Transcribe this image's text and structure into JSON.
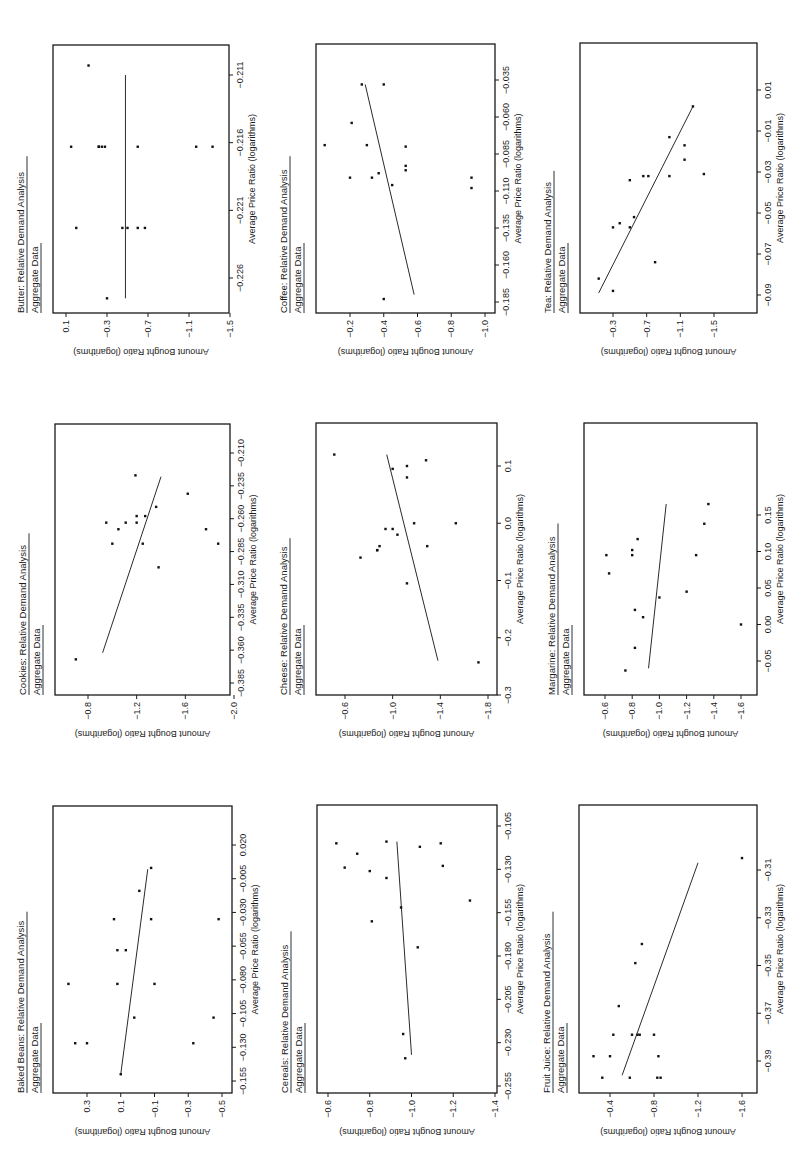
{
  "page": {
    "orientation": "rotated-90-ccw",
    "panel_subtitle": "Aggregate Data",
    "x_axis_label": "Average Price Ratio (logarithms)",
    "y_axis_label": "Amount Bought Ratio (logarithms)"
  },
  "chart_data": [
    {
      "type": "scatter",
      "title": "Butter: Relative Demand Analysis",
      "subtitle": "Aggregate Data",
      "xlabel": "Average Price Ratio (logarithms)",
      "ylabel": "Amount Bought Ratio (logarithms)",
      "xticks": [
        -0.226,
        -0.221,
        -0.216,
        -0.211
      ],
      "xtick_labels": [
        "-0.226",
        "-0.221",
        "-0.216",
        "-0.211"
      ],
      "yticks": [
        0.1,
        -0.3,
        -0.7,
        -1.1,
        -1.5
      ],
      "ytick_labels": [
        "0.1",
        "-0.3",
        "-0.7",
        "-1.1",
        "-1.5"
      ],
      "xlim": [
        -0.2288,
        -0.2086
      ],
      "ylim": [
        -1.5,
        0.2
      ],
      "points": [
        [
          -0.2275,
          -0.3
        ],
        [
          -0.2223,
          0.0
        ],
        [
          -0.2223,
          -0.45
        ],
        [
          -0.2223,
          -0.5
        ],
        [
          -0.2223,
          -0.6
        ],
        [
          -0.2223,
          -0.67
        ],
        [
          -0.2163,
          0.05
        ],
        [
          -0.2163,
          -0.22
        ],
        [
          -0.2163,
          -0.22
        ],
        [
          -0.2163,
          -0.25
        ],
        [
          -0.2163,
          -0.28
        ],
        [
          -0.2163,
          -0.6
        ],
        [
          -0.2163,
          -1.17
        ],
        [
          -0.2163,
          -1.33
        ],
        [
          -0.2103,
          -0.12
        ]
      ],
      "fit_line": [
        [
          -0.2275,
          -0.48
        ],
        [
          -0.211,
          -0.48
        ]
      ],
      "grid": false
    },
    {
      "type": "scatter",
      "title": "Coffee: Relative Demand Analysis",
      "subtitle": "Aggregate Data",
      "xlabel": "Average Price Ratio (logarithms)",
      "ylabel": "Amount Bought Ratio (logarithms)",
      "xticks": [
        -0.185,
        -0.16,
        -0.135,
        -0.11,
        -0.085,
        -0.06,
        -0.035
      ],
      "xtick_labels": [
        "-0.185",
        "-0.160",
        "-0.135",
        "-0.110",
        "-0.085",
        "-0.060",
        "-0.035"
      ],
      "yticks": [
        -0.2,
        -0.4,
        -0.6,
        -0.8,
        -1.0
      ],
      "ytick_labels": [
        "-0.2",
        "-0.4",
        "-0.6",
        "-0.8",
        "-1.0"
      ],
      "xlim": [
        -0.195,
        -0.025
      ],
      "ylim": [
        -1.05,
        0.05
      ],
      "points": [
        [
          -0.183,
          -0.4
        ],
        [
          -0.106,
          -0.45
        ],
        [
          -0.101,
          -0.2
        ],
        [
          -0.101,
          -0.33
        ],
        [
          -0.101,
          -0.92
        ],
        [
          -0.108,
          -0.92
        ],
        [
          -0.098,
          -0.37
        ],
        [
          -0.096,
          -0.53
        ],
        [
          -0.093,
          -0.53
        ],
        [
          -0.079,
          -0.05
        ],
        [
          -0.079,
          -0.3
        ],
        [
          -0.08,
          -0.53
        ],
        [
          -0.064,
          -0.21
        ],
        [
          -0.038,
          -0.27
        ],
        [
          -0.038,
          -0.4
        ]
      ],
      "fit_line": [
        [
          -0.18,
          -0.58
        ],
        [
          -0.038,
          -0.29
        ]
      ],
      "grid": false
    },
    {
      "type": "scatter",
      "title": "Tea: Relative Demand Analysis",
      "subtitle": "Aggregate Data",
      "xlabel": "Average Price Ratio (logarithms)",
      "ylabel": "Amount Bought Ratio (logarithms)",
      "xticks": [
        -0.09,
        -0.07,
        -0.05,
        -0.03,
        -0.01,
        0.01
      ],
      "xtick_labels": [
        "-0.09",
        "-0.07",
        "-0.05",
        "-0.03",
        "-0.01",
        "0.01"
      ],
      "yticks": [
        -0.3,
        -0.7,
        -1.1,
        -1.5
      ],
      "ytick_labels": [
        "-0.3",
        "-0.7",
        "-1.1",
        "-1.5"
      ],
      "xlim": [
        -0.1,
        0.01
      ],
      "ylim": [
        -1.5,
        -0.1
      ],
      "points": [
        [
          -0.088,
          -0.3
        ],
        [
          -0.082,
          -0.13
        ],
        [
          -0.074,
          -0.8
        ],
        [
          -0.057,
          -0.3
        ],
        [
          -0.057,
          -0.5
        ],
        [
          -0.055,
          -0.38
        ],
        [
          -0.052,
          -0.55
        ],
        [
          -0.034,
          -0.5
        ],
        [
          -0.032,
          -0.66
        ],
        [
          -0.032,
          -0.72
        ],
        [
          -0.032,
          -0.97
        ],
        [
          -0.031,
          -1.38
        ],
        [
          -0.024,
          -1.15
        ],
        [
          -0.017,
          -1.15
        ],
        [
          -0.013,
          -0.97
        ],
        [
          0.002,
          -1.25
        ]
      ],
      "fit_line": [
        [
          -0.089,
          -0.13
        ],
        [
          0.002,
          -1.25
        ]
      ],
      "grid": false
    },
    {
      "type": "scatter",
      "title": "Cookies: Relative Demand Analysis",
      "subtitle": "Aggregate Data",
      "xlabel": "Average Price Ratio (logarithms)",
      "ylabel": "Amount Bought Ratio (logarithms)",
      "xticks": [
        -0.385,
        -0.36,
        -0.335,
        -0.31,
        -0.285,
        -0.26,
        -0.235,
        -0.21
      ],
      "xtick_labels": [
        "-0.385",
        "-0.360",
        "-0.335",
        "-0.310",
        "-0.285",
        "-0.260",
        "-0.235",
        "-0.210"
      ],
      "yticks": [
        -0.8,
        -1.2,
        -1.6,
        -2.0
      ],
      "ytick_labels": [
        "-0.8",
        "-1.2",
        "-1.6",
        "-2.0"
      ],
      "xlim": [
        -0.395,
        -0.205
      ],
      "ylim": [
        -2.1,
        -0.6
      ],
      "points": [
        [
          -0.367,
          -0.7
        ],
        [
          -0.297,
          -1.38
        ],
        [
          -0.279,
          -1.0
        ],
        [
          -0.279,
          -1.25
        ],
        [
          -0.279,
          -1.87
        ],
        [
          -0.268,
          -1.05
        ],
        [
          -0.268,
          -1.77
        ],
        [
          -0.263,
          -0.95
        ],
        [
          -0.263,
          -1.11
        ],
        [
          -0.263,
          -1.2
        ],
        [
          -0.258,
          -1.2
        ],
        [
          -0.258,
          -1.27
        ],
        [
          -0.251,
          -1.36
        ],
        [
          -0.241,
          -1.62
        ],
        [
          -0.227,
          -1.19
        ]
      ],
      "fit_line": [
        [
          -0.362,
          -0.92
        ],
        [
          -0.228,
          -1.4
        ]
      ],
      "grid": false
    },
    {
      "type": "scatter",
      "title": "Cheese: Relative Demand Analysis",
      "subtitle": "Aggregate Data",
      "xlabel": "Average Price Ratio (logarithms)",
      "ylabel": "Amount Bought Ratio (logarithms)",
      "xticks": [
        -0.3,
        -0.2,
        -0.1,
        0.0,
        0.1
      ],
      "xtick_labels": [
        "-0.3",
        "-0.2",
        "-0.1",
        "0.0",
        "0.1"
      ],
      "yticks": [
        -0.6,
        -1.0,
        -1.4,
        -1.8
      ],
      "ytick_labels": [
        "-0.6",
        "-1.0",
        "-1.4",
        "-1.8"
      ],
      "xlim": [
        -0.3,
        0.17
      ],
      "ylim": [
        -1.8,
        -0.4
      ],
      "points": [
        [
          -0.243,
          -1.72
        ],
        [
          -0.105,
          -1.12
        ],
        [
          -0.06,
          -0.73
        ],
        [
          -0.047,
          -0.87
        ],
        [
          -0.047,
          -0.87
        ],
        [
          -0.04,
          -0.89
        ],
        [
          -0.04,
          -1.29
        ],
        [
          -0.02,
          -1.04
        ],
        [
          -0.01,
          -0.94
        ],
        [
          -0.01,
          -1.0
        ],
        [
          0.0,
          -1.18
        ],
        [
          0.0,
          -1.53
        ],
        [
          0.08,
          -1.12
        ],
        [
          0.095,
          -1.0
        ],
        [
          0.1,
          -1.12
        ],
        [
          0.11,
          -1.28
        ],
        [
          0.12,
          -0.51
        ]
      ],
      "fit_line": [
        [
          -0.24,
          -1.38
        ],
        [
          0.12,
          -0.95
        ]
      ],
      "grid": false
    },
    {
      "type": "scatter",
      "title": "Margarine: Relative Demand Analysis",
      "subtitle": "Aggregate Data",
      "xlabel": "Average Price Ratio (logarithms)",
      "ylabel": "Amount Bought Ratio (logarithms)",
      "xticks": [
        -0.05,
        0.0,
        0.05,
        0.1,
        0.15
      ],
      "xtick_labels": [
        "-0.05",
        "0.00",
        "0.05",
        "0.10",
        "0.15"
      ],
      "yticks": [
        -0.6,
        -0.8,
        -1.0,
        -1.2,
        -1.4,
        -1.6
      ],
      "ytick_labels": [
        "-0.6",
        "-0.8",
        "-1.0",
        "-1.2",
        "-1.4",
        "-1.6"
      ],
      "xlim": [
        -0.075,
        0.195
      ],
      "ylim": [
        -1.7,
        -0.48
      ],
      "points": [
        [
          -0.063,
          -0.75
        ],
        [
          -0.032,
          -0.82
        ],
        [
          0.01,
          -0.88
        ],
        [
          0.02,
          -0.82
        ],
        [
          0.037,
          -1.0
        ],
        [
          0.045,
          -1.2
        ],
        [
          0.07,
          -0.63
        ],
        [
          0.095,
          -0.61
        ],
        [
          0.095,
          -0.8
        ],
        [
          0.095,
          -1.27
        ],
        [
          0.102,
          -0.8
        ],
        [
          0.117,
          -0.84
        ],
        [
          0.138,
          -1.33
        ],
        [
          0.165,
          -1.36
        ],
        [
          0.0,
          -1.6
        ]
      ],
      "fit_line": [
        [
          -0.06,
          -0.92
        ],
        [
          0.165,
          -1.05
        ]
      ],
      "grid": false
    },
    {
      "type": "scatter",
      "title": "Baked Beans: Relative Demand Analysis",
      "subtitle": "Aggregate Data",
      "xlabel": "Average Price Ratio (logarithms)",
      "ylabel": "Amount Bought Ratio (logarithms)",
      "xticks": [
        -0.155,
        -0.13,
        -0.105,
        -0.08,
        -0.055,
        -0.03,
        -0.005,
        0.02
      ],
      "xtick_labels": [
        "-0.155",
        "-0.130",
        "-0.105",
        "-0.080",
        "-0.055",
        "-0.030",
        "-0.005",
        "0.020"
      ],
      "yticks": [
        0.3,
        0.1,
        -0.1,
        -0.3,
        -0.5
      ],
      "ytick_labels": [
        "0.3",
        "0.1",
        "-0.1",
        "-0.3",
        "-0.5"
      ],
      "xlim": [
        -0.165,
        0.03
      ],
      "ylim": [
        -0.55,
        0.5
      ],
      "points": [
        [
          -0.15,
          0.1
        ],
        [
          -0.127,
          0.37
        ],
        [
          -0.127,
          0.3
        ],
        [
          -0.127,
          -0.33
        ],
        [
          -0.108,
          0.02
        ],
        [
          -0.108,
          -0.45
        ],
        [
          -0.083,
          0.41
        ],
        [
          -0.083,
          0.12
        ],
        [
          -0.083,
          -0.1
        ],
        [
          -0.058,
          0.12
        ],
        [
          -0.058,
          0.07
        ],
        [
          -0.035,
          0.14
        ],
        [
          -0.035,
          -0.08
        ],
        [
          -0.035,
          -0.48
        ],
        [
          -0.014,
          -0.01
        ],
        [
          0.003,
          -0.08
        ]
      ],
      "fit_line": [
        [
          -0.15,
          0.1
        ],
        [
          0.002,
          -0.06
        ]
      ],
      "grid": false
    },
    {
      "type": "scatter",
      "title": "Cereals: Relative Demand Analysis",
      "subtitle": "Aggregate Data",
      "xlabel": "Average Price Ratio (logarithms)",
      "ylabel": "Amount Bought Ratio (logarithms)",
      "xticks": [
        -0.255,
        -0.23,
        -0.205,
        -0.18,
        -0.155,
        -0.13,
        -0.105
      ],
      "xtick_labels": [
        "-0.255",
        "-0.230",
        "-0.205",
        "-0.180",
        "-0.155",
        "-0.130",
        "-0.105"
      ],
      "yticks": [
        -0.6,
        -0.8,
        -1.0,
        -1.2,
        -1.4
      ],
      "ytick_labels": [
        "-0.6",
        "-0.8",
        "-1.0",
        "-1.2",
        "-1.4"
      ],
      "xlim": [
        -0.262,
        -0.098
      ],
      "ylim": [
        -1.4,
        -0.52
      ],
      "points": [
        [
          -0.239,
          -0.97
        ],
        [
          -0.225,
          -0.96
        ],
        [
          -0.175,
          -1.03
        ],
        [
          -0.16,
          -0.81
        ],
        [
          -0.152,
          -0.95
        ],
        [
          -0.148,
          -1.28
        ],
        [
          -0.135,
          -0.88
        ],
        [
          -0.131,
          -0.8
        ],
        [
          -0.129,
          -0.68
        ],
        [
          -0.128,
          -1.15
        ],
        [
          -0.121,
          -0.74
        ],
        [
          -0.117,
          -1.04
        ],
        [
          -0.114,
          -0.88
        ],
        [
          -0.115,
          -0.64
        ],
        [
          -0.115,
          -1.14
        ]
      ],
      "fit_line": [
        [
          -0.237,
          -1.0
        ],
        [
          -0.114,
          -0.93
        ]
      ],
      "grid": false
    },
    {
      "type": "scatter",
      "title": "Fruit Juice: Relative Demand Analysis",
      "subtitle": "Aggregate Data",
      "xlabel": "Average Price Ratio (logarithms)",
      "ylabel": "Amount Bought Ratio (logarithms)",
      "xticks": [
        -0.39,
        -0.37,
        -0.35,
        -0.33,
        -0.31
      ],
      "xtick_labels": [
        "-0.39",
        "-0.37",
        "-0.35",
        "-0.33",
        "-0.31"
      ],
      "yticks": [
        -0.4,
        -0.8,
        -1.2,
        -1.6
      ],
      "ytick_labels": [
        "-0.4",
        "-0.8",
        "-1.2",
        "-1.6"
      ],
      "xlim": [
        -0.403,
        -0.292
      ],
      "ylim": [
        -1.7,
        -0.15
      ],
      "points": [
        [
          -0.397,
          -0.33
        ],
        [
          -0.397,
          -0.58
        ],
        [
          -0.397,
          -0.83
        ],
        [
          -0.397,
          -0.86
        ],
        [
          -0.388,
          -0.25
        ],
        [
          -0.388,
          -0.4
        ],
        [
          -0.388,
          -0.84
        ],
        [
          -0.379,
          -0.43
        ],
        [
          -0.379,
          -0.6
        ],
        [
          -0.379,
          -0.65
        ],
        [
          -0.379,
          -0.67
        ],
        [
          -0.379,
          -0.8
        ],
        [
          -0.367,
          -0.48
        ],
        [
          -0.349,
          -0.63
        ],
        [
          -0.341,
          -0.69
        ],
        [
          -0.305,
          -1.6
        ]
      ],
      "fit_line": [
        [
          -0.396,
          -0.51
        ],
        [
          -0.307,
          -1.2
        ]
      ],
      "grid": false
    }
  ]
}
